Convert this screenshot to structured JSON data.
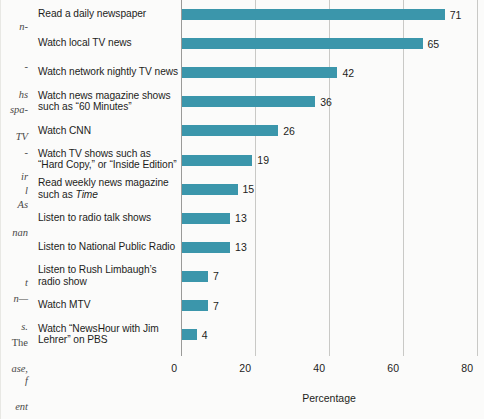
{
  "margin_text_fragments": [
    {
      "text": "n-",
      "top": 22
    },
    {
      "text": "-",
      "top": 62
    },
    {
      "text": "hs",
      "top": 90
    },
    {
      "text": "spa-",
      "top": 105
    },
    {
      "text": "TV",
      "top": 132
    },
    {
      "text": "-",
      "top": 148
    },
    {
      "text": "ir",
      "top": 172
    },
    {
      "text": "l",
      "top": 186
    },
    {
      "text": "As",
      "top": 200
    },
    {
      "text": "nan",
      "top": 228
    },
    {
      "text": "t",
      "top": 278
    },
    {
      "text": "n—",
      "top": 294
    },
    {
      "text": "s.",
      "top": 322
    },
    {
      "text": "The",
      "top": 338,
      "upright": true
    },
    {
      "text": "ase,",
      "top": 364
    },
    {
      "text": "f",
      "top": 376
    },
    {
      "text": "ent",
      "top": 402
    }
  ],
  "chart_data": {
    "type": "bar",
    "orientation": "horizontal",
    "title": "",
    "xlabel": "Percentage",
    "ylabel": "",
    "xlim": [
      0,
      80
    ],
    "xticks": [
      0,
      20,
      40,
      60,
      80
    ],
    "grid": "vertical",
    "legend": "none",
    "bar_color": "#3b96ab",
    "categories": [
      "Read a daily newspaper",
      "Watch local TV news",
      "Watch network nightly TV news",
      "Watch news magazine shows such as “60 Minutes”",
      "Watch CNN",
      "Watch TV shows such as “Hard Copy,” or “Inside Edition”",
      "Read weekly news magazine such as Time",
      "Listen to radio talk shows",
      "Listen to National Public Radio",
      "Listen to Rush Limbaugh’s radio show",
      "Watch MTV",
      "Watch “NewsHour with Jim Lehrer” on PBS"
    ],
    "values": [
      71,
      65,
      42,
      36,
      26,
      19,
      15,
      13,
      13,
      7,
      7,
      4
    ],
    "category_lines": [
      [
        "Read a daily newspaper"
      ],
      [
        "Watch local TV news"
      ],
      [
        "Watch network nightly TV news"
      ],
      [
        "Watch news magazine shows",
        "such as “60 Minutes”"
      ],
      [
        "Watch CNN"
      ],
      [
        "Watch TV shows such as",
        "“Hard Copy,” or “Inside Edition”"
      ],
      [
        "Read weekly news magazine",
        "such as |i|Time|/i|"
      ],
      [
        "Listen to radio talk shows"
      ],
      [
        "Listen to National Public Radio"
      ],
      [
        "Listen to Rush Limbaugh’s",
        "radio show"
      ],
      [
        "Watch MTV"
      ],
      [
        "Watch “NewsHour with Jim",
        "Lehrer” on PBS"
      ]
    ]
  }
}
